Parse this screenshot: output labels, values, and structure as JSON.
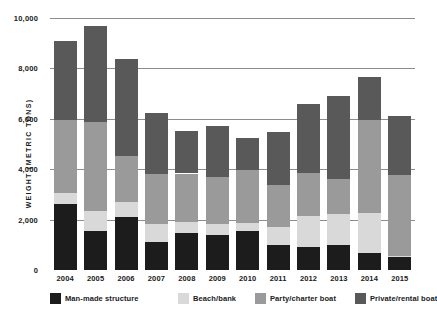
{
  "chart_data": {
    "type": "bar",
    "stacked": true,
    "title": "",
    "xlabel": "",
    "ylabel": "WEIGHT (METRIC TONS)",
    "ylim": [
      0,
      10000
    ],
    "ytick_labels": [
      "0",
      "2,000",
      "4,000",
      "6,000",
      "8,000",
      "10,000"
    ],
    "ytick_values": [
      0,
      2000,
      4000,
      6000,
      8000,
      10000
    ],
    "grid": true,
    "legend_position": "bottom",
    "categories": [
      "2004",
      "2005",
      "2006",
      "2007",
      "2008",
      "2009",
      "2010",
      "2011",
      "2012",
      "2013",
      "2014",
      "2015"
    ],
    "series": [
      {
        "name": "Man-made structure",
        "color": "#1c1c1c",
        "values": [
          2620,
          1530,
          2100,
          1130,
          1450,
          1370,
          1530,
          1010,
          930,
          1010,
          690,
          500
        ]
      },
      {
        "name": "Beach/bank",
        "color": "#d9d9d9",
        "values": [
          450,
          810,
          600,
          690,
          440,
          460,
          320,
          680,
          1230,
          1200,
          1590,
          60
        ]
      },
      {
        "name": "Party/charter boat",
        "color": "#9a9a9a",
        "values": [
          2900,
          3550,
          1810,
          1980,
          1940,
          1860,
          2100,
          1690,
          1690,
          1410,
          3670,
          3230
        ]
      },
      {
        "name": "Private/rental boat",
        "color": "#595959",
        "values": [
          3100,
          3790,
          3870,
          2430,
          1690,
          2010,
          1290,
          2080,
          2730,
          3270,
          1700,
          2340
        ]
      }
    ],
    "totals": [
      9070,
      9680,
      8380,
      6230,
      5520,
      5700,
      5240,
      5460,
      6580,
      6890,
      7650,
      6130
    ]
  },
  "legend": {
    "items": [
      {
        "label": "Man-made structure"
      },
      {
        "label": "Beach/bank"
      },
      {
        "label": "Party/charter boat"
      },
      {
        "label": "Private/rental boat"
      }
    ]
  }
}
